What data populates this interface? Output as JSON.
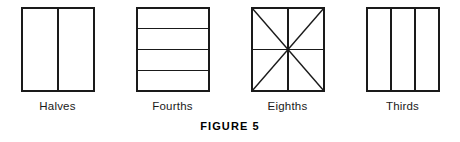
{
  "figure": {
    "caption": "FIGURE 5",
    "background_color": "#ffffff",
    "line_color": "#1a1a1a",
    "shapes": [
      {
        "id": "halves",
        "label": "Halves",
        "partition_type": "vertical",
        "parts": 2,
        "divider_count": 1,
        "has_diagonals": false
      },
      {
        "id": "fourths",
        "label": "Fourths",
        "partition_type": "horizontal",
        "parts": 4,
        "divider_count": 3,
        "has_diagonals": false
      },
      {
        "id": "eighths",
        "label": "Eighths",
        "partition_type": "radial",
        "parts": 8,
        "divider_count": 4,
        "has_diagonals": true
      },
      {
        "id": "thirds",
        "label": "Thirds",
        "partition_type": "vertical",
        "parts": 3,
        "divider_count": 2,
        "has_diagonals": false
      }
    ]
  }
}
